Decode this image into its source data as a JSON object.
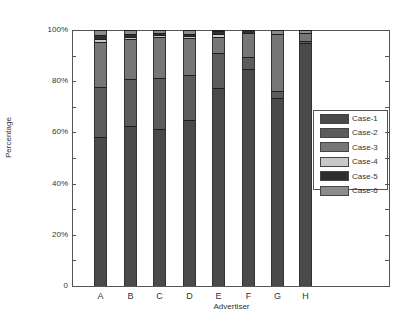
{
  "chart_data": {
    "type": "bar",
    "stacked": true,
    "title": "",
    "xlabel": "Advertiser",
    "ylabel": "Percentage",
    "ylim": [
      0,
      100
    ],
    "yticks": [
      "0",
      "20%",
      "40%",
      "60%",
      "80%",
      "100%"
    ],
    "grid": false,
    "legend_position": "right, inside plot, middle",
    "categories": [
      "A",
      "B",
      "C",
      "D",
      "E",
      "F",
      "G",
      "H"
    ],
    "series": [
      {
        "name": "Case-1",
        "color": "#4a4a4a",
        "values": [
          58.2,
          62.5,
          61.3,
          64.8,
          77.3,
          84.8,
          73.4,
          95.0
        ]
      },
      {
        "name": "Case-2",
        "color": "#5c5c5c",
        "values": [
          19.5,
          18.4,
          20.0,
          17.6,
          13.7,
          4.7,
          2.8,
          0.8
        ]
      },
      {
        "name": "Case-3",
        "color": "#767676",
        "values": [
          17.6,
          15.6,
          16.0,
          14.5,
          6.3,
          9.5,
          22.2,
          2.9
        ]
      },
      {
        "name": "Case-4",
        "color": "#c8c8c8",
        "values": [
          1.2,
          0.8,
          0.7,
          0.8,
          1.2,
          0.0,
          0.0,
          0.0
        ]
      },
      {
        "name": "Case-5",
        "color": "#2e2e2e",
        "values": [
          1.5,
          1.1,
          0.8,
          0.7,
          1.0,
          1.0,
          0.0,
          0.0
        ]
      },
      {
        "name": "Case-6",
        "color": "#8c8c8c",
        "values": [
          2.0,
          1.6,
          1.2,
          1.6,
          0.5,
          0.0,
          1.6,
          1.3
        ]
      }
    ]
  },
  "axis": {
    "ylabel": "Percentage",
    "xlabel": "Advertiser",
    "yticks": [
      "0",
      "20%",
      "40%",
      "60%",
      "80%",
      "100%"
    ],
    "xticks": [
      "A",
      "B",
      "C",
      "D",
      "E",
      "F",
      "G",
      "H"
    ]
  },
  "legend": {
    "items": [
      "Case-1",
      "Case-2",
      "Case-3",
      "Case-4",
      "Case-5",
      "Case-6"
    ]
  }
}
